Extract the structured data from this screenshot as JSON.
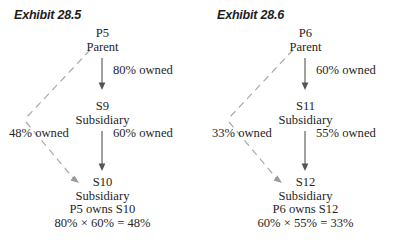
{
  "exhibits": [
    {
      "title": "Exhibit 28.5",
      "parent": {
        "code": "P5",
        "role": "Parent"
      },
      "middle": {
        "code": "S9",
        "role": "Subsidiary"
      },
      "bottom": {
        "code": "S10",
        "role": "Subsidiary",
        "ownership": "P5 owns S10",
        "calculation": "80% × 60% = 48%"
      },
      "edges": {
        "parent_to_middle": "80% owned",
        "middle_to_bottom": "60% owned",
        "parent_to_bottom": "48% owned"
      }
    },
    {
      "title": "Exhibit 28.6",
      "parent": {
        "code": "P6",
        "role": "Parent"
      },
      "middle": {
        "code": "S11",
        "role": "Subsidiary"
      },
      "bottom": {
        "code": "S12",
        "role": "Subsidiary",
        "ownership": "P6 owns S12",
        "calculation": "60% × 55% = 33%"
      },
      "edges": {
        "parent_to_middle": "60% owned",
        "middle_to_bottom": "55% owned",
        "parent_to_bottom": "33% owned"
      }
    }
  ],
  "colors": {
    "text": "#262626",
    "solid_edge": "#555555",
    "dashed_edge": "#a9a9a9",
    "background": "#ffffff"
  }
}
